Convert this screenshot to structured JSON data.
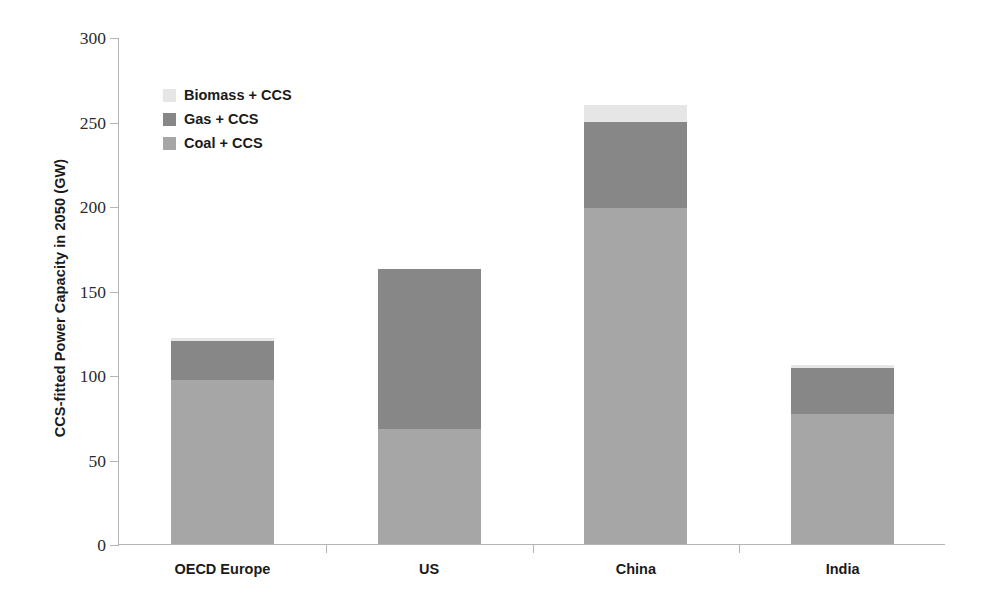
{
  "chart_data": {
    "type": "bar",
    "subtype": "stacked-vertical",
    "title": "",
    "xlabel": "",
    "ylabel": "CCS-fitted Power Capacity in 2050 (GW)",
    "categories": [
      "OECD Europe",
      "US",
      "China",
      "India"
    ],
    "series": [
      {
        "name": "Coal + CCS",
        "color": "#a6a6a6",
        "values": [
          97,
          68,
          199,
          77
        ]
      },
      {
        "name": "Gas + CCS",
        "color": "#878787",
        "values": [
          23,
          95,
          51,
          27
        ]
      },
      {
        "name": "Biomass + CCS",
        "color": "#e6e6e6",
        "values": [
          2,
          0,
          10,
          2
        ]
      }
    ],
    "totals": [
      122,
      163,
      260,
      106
    ],
    "ylim": [
      0,
      300
    ],
    "yticks": [
      0,
      50,
      100,
      150,
      200,
      250,
      300
    ],
    "ytick_labels": [
      "0",
      "50",
      "100",
      "150",
      "200",
      "250",
      "300"
    ],
    "grid": false,
    "legend_position": "upper-left-inside",
    "legend_order": [
      "Biomass + CCS",
      "Gas + CCS",
      "Coal + CCS"
    ],
    "axis_color": "#b4b4b4",
    "background": "#ffffff"
  },
  "legend": {
    "items": [
      {
        "label": "Biomass + CCS",
        "color": "#e6e6e6"
      },
      {
        "label": "Gas + CCS",
        "color": "#878787"
      },
      {
        "label": "Coal + CCS",
        "color": "#a6a6a6"
      }
    ]
  }
}
